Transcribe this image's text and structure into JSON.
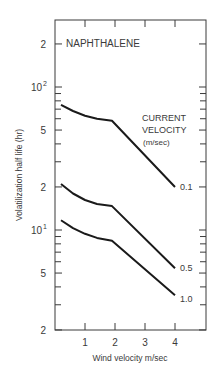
{
  "chart_data": {
    "type": "line",
    "title": "NAPHTHALENE",
    "xlabel": "Wind velocity m/sec",
    "ylabel": "Volatilization half life (hr)",
    "yscale": "log",
    "ylim": [
      2,
      300
    ],
    "xlim": [
      0,
      5
    ],
    "x_ticks": [
      "1",
      "2",
      "3",
      "4"
    ],
    "y_ticks": [
      {
        "value": 200,
        "label": "2"
      },
      {
        "value": 100,
        "label": "10",
        "sup": "2"
      },
      {
        "value": 50,
        "label": "5"
      },
      {
        "value": 20,
        "label": "2"
      },
      {
        "value": 10,
        "label": "10",
        "sup": "1"
      },
      {
        "value": 5,
        "label": "5"
      },
      {
        "value": 2,
        "label": "2"
      }
    ],
    "legend_title": [
      "CURRENT",
      "VELOCITY",
      "(m/sec)"
    ],
    "grid": false,
    "series": [
      {
        "name": "0.1",
        "x": [
          0.2,
          0.6,
          1.0,
          1.4,
          1.9,
          4.0
        ],
        "y": [
          75,
          68,
          63,
          60,
          58,
          20
        ]
      },
      {
        "name": "0.5",
        "x": [
          0.2,
          0.6,
          1.0,
          1.4,
          1.9,
          4.0
        ],
        "y": [
          21,
          18,
          16.2,
          15.2,
          14.7,
          5.4
        ]
      },
      {
        "name": "1.0",
        "x": [
          0.2,
          0.6,
          1.0,
          1.4,
          1.9,
          4.0
        ],
        "y": [
          11.7,
          10.3,
          9.4,
          8.8,
          8.4,
          3.5
        ]
      }
    ]
  }
}
